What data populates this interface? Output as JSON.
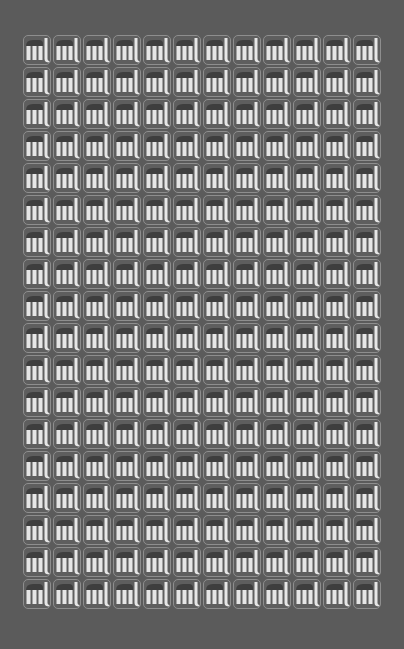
{
  "canvas": {
    "width": 404,
    "height": 649,
    "background_color": "#5b5b5b"
  },
  "grid": {
    "columns": 12,
    "rows": 18,
    "tile_count": 216,
    "tile_icon": "ml-logo-icon",
    "tile_border_color": "#8e8e8e",
    "tile_fill_color": "#5e5e5e",
    "glyph_light_color": "#e6e6e6",
    "glyph_dark_color": "#3e3e3e"
  }
}
